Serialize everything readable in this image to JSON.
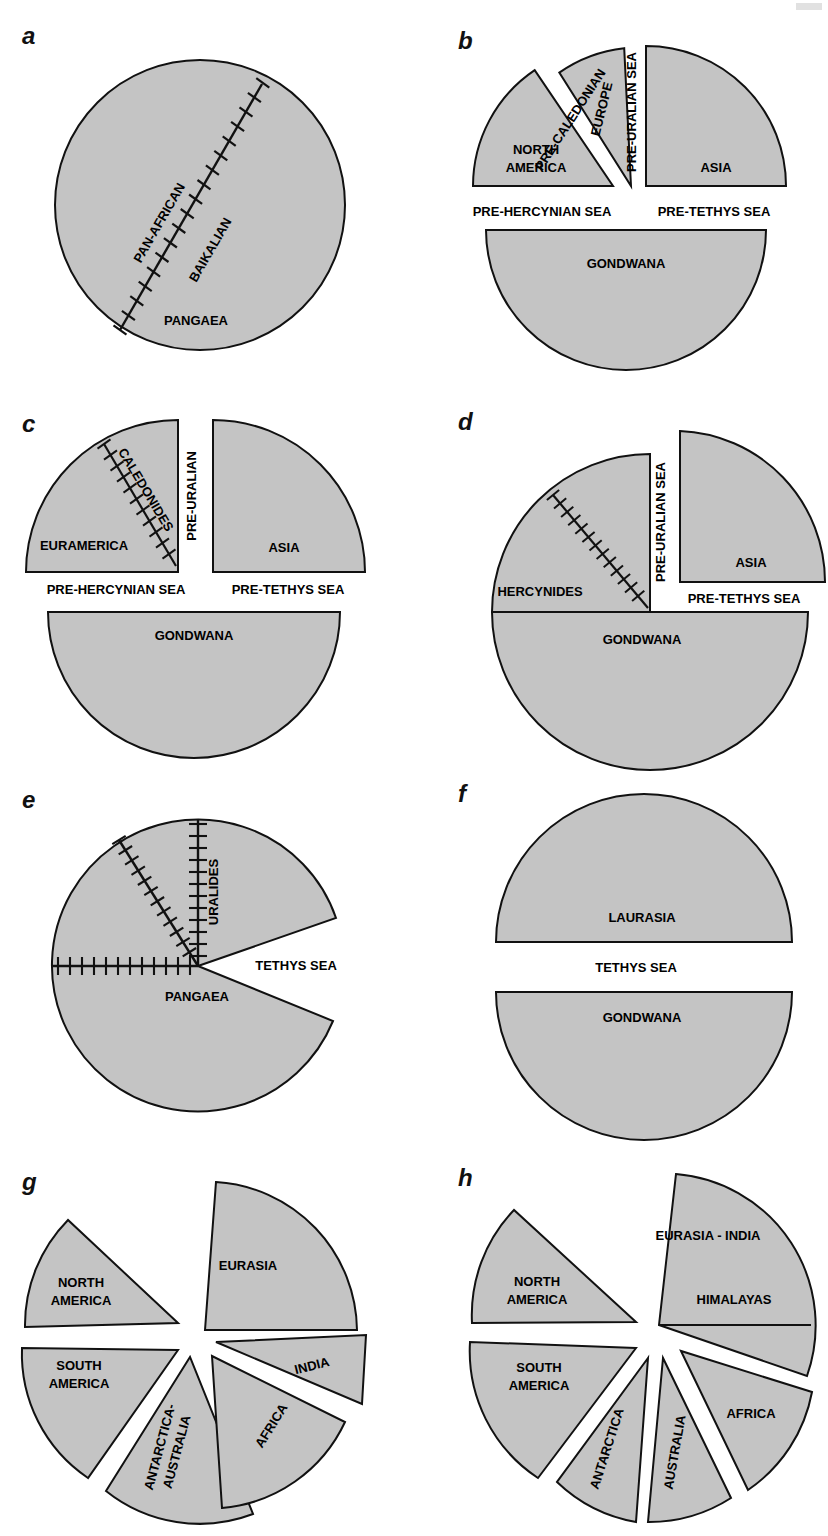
{
  "figure": {
    "fill_color": "#c4c4c4",
    "stroke_color": "#111111",
    "background": "#ffffff",
    "suture_symbol": "tick-marked-line"
  },
  "panels": [
    {
      "letter": "a",
      "shape": "full-circle",
      "labels": {
        "continent": "PANGAEA",
        "suture_left": "PAN-AFRICAN",
        "suture_right": "BAIKALIAN"
      }
    },
    {
      "letter": "b",
      "shape": "exploded-sectors",
      "labels": {
        "north_america": "NORTH\nAMERICA",
        "north_america_line1": "NORTH",
        "north_america_line2": "AMERICA",
        "europe": "EUROPE",
        "asia": "ASIA",
        "pre_caledonian": "PRE-CALEDONIAN",
        "pre_uralian_sea": "PRE-URALIAN SEA",
        "pre_hercynian_sea": "PRE-HERCYNIAN SEA",
        "pre_tethys_sea": "PRE-TETHYS SEA",
        "gondwana": "GONDWANA"
      }
    },
    {
      "letter": "c",
      "shape": "quadrants-plus-hemisphere",
      "labels": {
        "euramerica": "EURAMERICA",
        "caledonides": "CALEDONIDES",
        "pre_uralian": "PRE-URALIAN",
        "asia": "ASIA",
        "pre_hercynian_sea": "PRE-HERCYNIAN SEA",
        "pre_tethys_sea": "PRE-TETHYS SEA",
        "gondwana": "GONDWANA"
      }
    },
    {
      "letter": "d",
      "shape": "quadrant-joined-hemisphere",
      "labels": {
        "hercynides": "HERCYNIDES",
        "pre_uralian_sea": "PRE-URALIAN SEA",
        "asia": "ASIA",
        "pre_tethys_sea": "PRE-TETHYS SEA",
        "gondwana": "GONDWANA"
      }
    },
    {
      "letter": "e",
      "shape": "circle-with-wedge-cut",
      "labels": {
        "pangaea": "PANGAEA",
        "uralides": "URALIDES",
        "tethys_sea": "TETHYS SEA"
      }
    },
    {
      "letter": "f",
      "shape": "two-hemispheres",
      "labels": {
        "laurasia": "LAURASIA",
        "tethys_sea": "TETHYS SEA",
        "gondwana": "GONDWANA"
      }
    },
    {
      "letter": "g",
      "shape": "exploded-pie-six",
      "labels": {
        "eurasia": "EURASIA",
        "north_america_line1": "NORTH",
        "north_america_line2": "AMERICA",
        "south_america_line1": "SOUTH",
        "south_america_line2": "AMERICA",
        "antarctica_australia_line1": "ANTARCTICA-",
        "antarctica_australia_line2": "AUSTRALIA",
        "africa": "AFRICA",
        "india": "INDIA"
      }
    },
    {
      "letter": "h",
      "shape": "exploded-pie-six",
      "labels": {
        "eurasia_india": "EURASIA - INDIA",
        "himalayas": "HIMALAYAS",
        "north_america_line1": "NORTH",
        "north_america_line2": "AMERICA",
        "south_america_line1": "SOUTH",
        "south_america_line2": "AMERICA",
        "antarctica": "ANTARCTICA",
        "australia": "AUSTRALIA",
        "africa": "AFRICA"
      }
    }
  ]
}
